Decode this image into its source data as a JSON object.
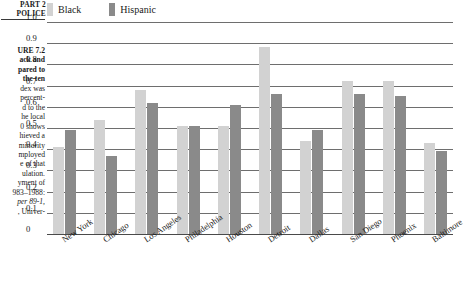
{
  "running_head": {
    "line1": "PART 2",
    "line2": "POLICE"
  },
  "caption": {
    "lines": [
      {
        "text": "URE 7.2",
        "bold": true,
        "italic": false
      },
      {
        "text": "ack and",
        "bold": true,
        "italic": false
      },
      {
        "text": "pared to",
        "bold": true,
        "italic": false
      },
      {
        "text": "the ten",
        "bold": true,
        "italic": false
      },
      {
        "text": "dex was",
        "bold": false,
        "italic": false
      },
      {
        "text": "percent-",
        "bold": false,
        "italic": false
      },
      {
        "text": "d to the",
        "bold": false,
        "italic": false
      },
      {
        "text": "he local",
        "bold": false,
        "italic": false
      },
      {
        "text": "0 shows",
        "bold": false,
        "italic": false
      },
      {
        "text": "hieved a",
        "bold": false,
        "italic": false
      },
      {
        "text": "minority",
        "bold": false,
        "italic": false
      },
      {
        "text": "mployed",
        "bold": false,
        "italic": false
      },
      {
        "text": "e of that",
        "bold": false,
        "italic": false
      },
      {
        "text": "ulation.",
        "bold": false,
        "italic": false
      },
      {
        "text": "yment of",
        "bold": false,
        "italic": false
      },
      {
        "text": "983–1988:",
        "bold": false,
        "italic": false
      },
      {
        "text": "per 89-1,",
        "bold": false,
        "italic": true
      },
      {
        "text": ", Univer-",
        "bold": false,
        "italic": false
      }
    ]
  },
  "colors": {
    "black_series": "#d2d2d2",
    "hispanic_series": "#8a8a8a",
    "gridline": "#6e6e6e",
    "text": "#1a1a1a"
  },
  "chart_data": {
    "type": "bar",
    "title": "",
    "xlabel": "",
    "ylabel": "",
    "ylim": [
      0,
      1.0
    ],
    "yticks": [
      "0",
      "0.1",
      "0.2",
      "0.3",
      "0.4",
      "0.5",
      "0.6",
      "0.7",
      "0.8",
      "0.9",
      "1.0"
    ],
    "grid": true,
    "legend_position": "top-left",
    "categories": [
      "New York",
      "Chicago",
      "Los Angeles",
      "Philadelphia",
      "Houston",
      "Detroit",
      "Dallas",
      "San Diego",
      "Phoenix",
      "Baltimore"
    ],
    "series": [
      {
        "name": "Black",
        "color": "#d2d2d2",
        "values": [
          0.41,
          0.54,
          0.68,
          0.51,
          0.51,
          0.88,
          0.44,
          0.72,
          0.72,
          0.43
        ]
      },
      {
        "name": "Hispanic",
        "color": "#8a8a8a",
        "values": [
          0.49,
          0.37,
          0.62,
          0.51,
          0.61,
          0.66,
          0.49,
          0.66,
          0.65,
          0.39
        ]
      }
    ]
  }
}
